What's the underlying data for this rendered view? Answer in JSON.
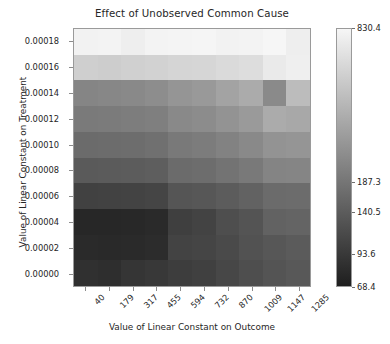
{
  "chart_data": {
    "type": "heatmap",
    "title": "Effect of Unobserved Common Cause",
    "xlabel": "Value of Linear Constant on Outcome",
    "ylabel": "Value of Linear Constant on Treatment",
    "grid": false,
    "legend_position": "right-colorbar",
    "x_tick_labels": [
      "40",
      "179",
      "317",
      "455",
      "594",
      "732",
      "870",
      "1009",
      "1147",
      "1285"
    ],
    "y_tick_labels": [
      "0.00000",
      "0.00002",
      "0.00004",
      "0.00006",
      "0.00008",
      "0.00010",
      "0.00012",
      "0.00014",
      "0.00016",
      "0.00018"
    ],
    "x": [
      40,
      179,
      317,
      455,
      594,
      732,
      870,
      1009,
      1147,
      1285
    ],
    "y": [
      0.0,
      2e-05,
      4e-05,
      6e-05,
      8e-05,
      0.0001,
      0.00012,
      0.00014,
      0.00016,
      0.00018
    ],
    "colorbar": {
      "tick_labels": [
        "830.4",
        "187.3",
        "140.5",
        "93.6",
        "68.4"
      ],
      "tick_values": [
        830.4,
        187.3,
        140.5,
        93.6,
        68.4
      ],
      "vmin": 68.4,
      "vmax": 830.4,
      "scale": "log",
      "colormap": "gray_reversed_light_high"
    },
    "values": [
      [
        74.0,
        73.0,
        77.0,
        79.0,
        82.0,
        84.0,
        90.0,
        97.0,
        104.0,
        110.0
      ],
      [
        70.0,
        69.5,
        70.5,
        72.0,
        86.0,
        88.0,
        92.0,
        100.0,
        106.0,
        112.0
      ],
      [
        68.4,
        68.6,
        69.0,
        70.0,
        83.0,
        86.0,
        96.0,
        103.0,
        118.0,
        120.0
      ],
      [
        84.0,
        85.0,
        86.0,
        88.0,
        103.0,
        106.0,
        112.0,
        120.0,
        132.0,
        134.0
      ],
      [
        107.0,
        108.0,
        110.0,
        112.0,
        128.0,
        132.0,
        140.0,
        150.0,
        168.0,
        170.0
      ],
      [
        128.0,
        130.0,
        132.0,
        136.0,
        150.0,
        155.0,
        166.0,
        178.0,
        196.0,
        200.0
      ],
      [
        150.0,
        152.0,
        156.0,
        160.0,
        176.0,
        182.0,
        196.0,
        212.0,
        250.0,
        244.0
      ],
      [
        170.0,
        174.0,
        178.0,
        186.0,
        202.0,
        210.0,
        228.0,
        248.0,
        172.0,
        300.0
      ],
      [
        440.0,
        430.0,
        445.0,
        455.0,
        470.0,
        480.0,
        500.0,
        520.0,
        640.0,
        690.0
      ],
      [
        760.0,
        770.0,
        700.0,
        780.0,
        790.0,
        800.0,
        760.0,
        780.0,
        820.0,
        700.0
      ]
    ],
    "cell_colors": [
      [
        "#303030",
        "#2e2e2e",
        "#353535",
        "#383838",
        "#3d3d3d",
        "#404040",
        "#474747",
        "#4e4e4e",
        "#545454",
        "#585858"
      ],
      [
        "#2a2a2a",
        "#292929",
        "#2a2a2a",
        "#2c2c2c",
        "#434343",
        "#454545",
        "#4a4a4a",
        "#525252",
        "#575757",
        "#5b5b5b"
      ],
      [
        "#272727",
        "#272727",
        "#282828",
        "#2a2a2a",
        "#3f3f3f",
        "#434343",
        "#4e4e4e",
        "#545454",
        "#626262",
        "#646464"
      ],
      [
        "#414141",
        "#424242",
        "#434343",
        "#454545",
        "#555555",
        "#575757",
        "#5c5c5c",
        "#626262",
        "#6b6b6b",
        "#6c6c6c"
      ],
      [
        "#5a5a5a",
        "#5b5b5b",
        "#5c5c5c",
        "#5e5e5e",
        "#6b6b6b",
        "#6d6d6d",
        "#737373",
        "#797979",
        "#848484",
        "#858585"
      ],
      [
        "#6b6b6b",
        "#6c6c6c",
        "#6d6d6d",
        "#707070",
        "#797979",
        "#7c7c7c",
        "#828282",
        "#898989",
        "#939393",
        "#959595"
      ],
      [
        "#7a7a7a",
        "#7b7b7b",
        "#7d7d7d",
        "#7f7f7f",
        "#898989",
        "#8c8c8c",
        "#939393",
        "#9a9a9a",
        "#ababab",
        "#a8a8a8"
      ],
      [
        "#858585",
        "#878787",
        "#898989",
        "#8d8d8d",
        "#959595",
        "#999999",
        "#a3a3a3",
        "#ababab",
        "#8a8a8a",
        "#bcbcbc"
      ],
      [
        "#cfcfcf",
        "#cdcdcd",
        "#d0d0d0",
        "#d2d2d2",
        "#d5d5d5",
        "#d6d6d6",
        "#dadada",
        "#dddddd",
        "#eaeaea",
        "#efefef"
      ],
      [
        "#f2f2f2",
        "#f3f3f3",
        "#eeeeee",
        "#f3f3f3",
        "#f4f4f4",
        "#f5f5f5",
        "#f2f2f2",
        "#f3f3f3",
        "#f6f6f6",
        "#eeeeee"
      ]
    ]
  }
}
